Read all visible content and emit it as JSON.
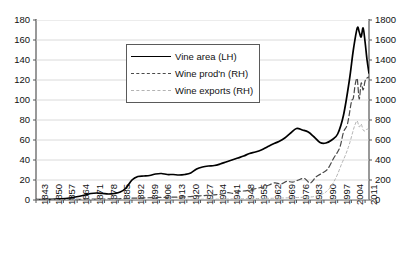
{
  "chart_data": {
    "type": "line",
    "title": "",
    "xlabel": "",
    "ylabel_left": "",
    "ylabel_right": "",
    "grid": true,
    "legend_position": "upper-center-left",
    "xlim": [
      1843,
      2013
    ],
    "ylim_left": [
      0,
      180
    ],
    "ylim_right": [
      0,
      1800
    ],
    "y_left_ticks": [
      0,
      20,
      40,
      60,
      80,
      100,
      120,
      140,
      160,
      180
    ],
    "y_right_ticks": [
      0,
      200,
      400,
      600,
      800,
      1000,
      1200,
      1400,
      1600,
      1800
    ],
    "x_ticks": [
      1843,
      1850,
      1857,
      1864,
      1871,
      1878,
      1885,
      1892,
      1899,
      1906,
      1913,
      1920,
      1927,
      1934,
      1941,
      1948,
      1955,
      1962,
      1969,
      1976,
      1983,
      1990,
      1997,
      2004,
      2011
    ],
    "series": [
      {
        "name": "Vine area (LH)",
        "axis": "left",
        "style": "solid",
        "color": "#000000",
        "x": [
          1843,
          1848,
          1853,
          1858,
          1863,
          1868,
          1871,
          1874,
          1877,
          1880,
          1883,
          1886,
          1889,
          1892,
          1895,
          1898,
          1901,
          1904,
          1907,
          1910,
          1913,
          1916,
          1919,
          1922,
          1925,
          1928,
          1931,
          1934,
          1937,
          1940,
          1943,
          1946,
          1949,
          1952,
          1955,
          1958,
          1961,
          1964,
          1967,
          1970,
          1973,
          1976,
          1979,
          1982,
          1985,
          1988,
          1991,
          1994,
          1997,
          2000,
          2003,
          2005,
          2007,
          2008,
          2009,
          2010,
          2011,
          2012,
          2013
        ],
        "values": [
          0.3,
          0.5,
          0.8,
          1.5,
          3,
          5,
          6.5,
          7,
          6.5,
          6,
          6.5,
          8,
          12,
          20,
          23.5,
          24,
          24.5,
          26,
          26.5,
          25.5,
          25.5,
          25,
          25.5,
          27,
          31,
          33,
          34,
          34.5,
          36,
          38,
          40,
          42,
          44,
          46.5,
          48,
          50,
          53,
          56,
          58.5,
          62,
          67,
          71.5,
          70,
          68,
          63,
          57.5,
          57,
          60,
          66,
          85,
          120,
          150,
          172,
          168,
          163,
          172,
          158,
          140,
          127
        ]
      },
      {
        "name": "Wine prod'n (RH)",
        "axis": "right",
        "style": "dashed",
        "color": "#4a4a4a",
        "x": [
          1843,
          1853,
          1863,
          1871,
          1878,
          1885,
          1892,
          1899,
          1906,
          1913,
          1920,
          1925,
          1930,
          1934,
          1938,
          1941,
          1944,
          1947,
          1950,
          1953,
          1956,
          1959,
          1962,
          1965,
          1968,
          1971,
          1974,
          1977,
          1980,
          1983,
          1986,
          1989,
          1992,
          1995,
          1998,
          2000,
          2002,
          2004,
          2005,
          2006,
          2007,
          2008,
          2009,
          2010,
          2011,
          2012,
          2013
        ],
        "values": [
          1,
          3,
          6,
          9,
          10,
          12,
          18,
          22,
          26,
          28,
          32,
          40,
          46,
          52,
          60,
          74,
          66,
          86,
          92,
          104,
          118,
          130,
          150,
          172,
          160,
          186,
          178,
          200,
          216,
          170,
          232,
          268,
          312,
          420,
          520,
          680,
          760,
          980,
          1020,
          1160,
          1210,
          1010,
          1170,
          1100,
          1190,
          1220,
          1230
        ]
      },
      {
        "name": "Wine exports (RH)",
        "axis": "right",
        "style": "dotted",
        "color": "#b3b3b3",
        "x": [
          1843,
          1863,
          1885,
          1899,
          1913,
          1927,
          1941,
          1955,
          1965,
          1975,
          1983,
          1986,
          1989,
          1991,
          1993,
          1995,
          1997,
          1999,
          2001,
          2003,
          2005,
          2006,
          2007,
          2008,
          2009,
          2010,
          2011,
          2012,
          2013
        ],
        "values": [
          0,
          1,
          2,
          4,
          6,
          8,
          10,
          14,
          18,
          24,
          30,
          40,
          58,
          80,
          120,
          180,
          260,
          360,
          450,
          560,
          700,
          760,
          790,
          730,
          760,
          700,
          690,
          710,
          700
        ]
      }
    ]
  },
  "legend": {
    "items": [
      {
        "label": "Vine area (LH)",
        "style": "solid"
      },
      {
        "label": "Wine prod'n (RH)",
        "style": "dashed"
      },
      {
        "label": "Wine exports (RH)",
        "style": "dotted"
      }
    ]
  },
  "colors": {
    "vine_area": "#000000",
    "wine_production": "#4a4a4a",
    "wine_exports": "#b3b3b3",
    "grid": "#d0d0d0",
    "axis": "#555555",
    "background": "#ffffff"
  }
}
